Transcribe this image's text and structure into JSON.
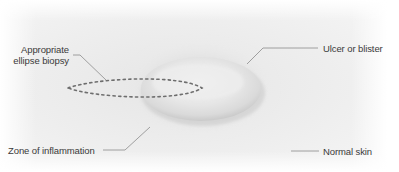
{
  "diagram": {
    "colors": {
      "background": "#ffffff",
      "skin": "#ededed",
      "skin_edge": "#f8f8f8",
      "ulcer_fill": "#e4e4e4",
      "ulcer_shadow": "#c9c9c9",
      "inflammation": "#d8d8d8",
      "dashes": "#6e6e6e",
      "leader_lines": "#8a8a8a",
      "text": "#3a3a3a"
    },
    "labels": {
      "biopsy_line1": "Appropriate",
      "biopsy_line2": "ellipse biopsy",
      "ulcer": "Ulcer or blister",
      "inflammation": "Zone of inflammation",
      "normal_skin": "Normal skin"
    }
  }
}
